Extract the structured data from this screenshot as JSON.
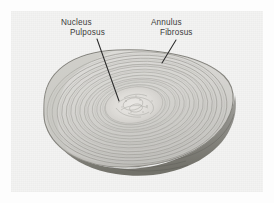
{
  "figure": {
    "type": "anatomical-photograph",
    "background_color": "#fdfdfd",
    "plate_color": "#f3f3f2"
  },
  "labels": [
    {
      "name": "nucleus-pulposus",
      "line1": "Nucleus",
      "line2": "Pulposus",
      "text_color": "#3b3b3b",
      "leader": {
        "x1": 97,
        "y1": 39,
        "x2": 119,
        "y2": 101
      }
    },
    {
      "name": "annulus-fibrosus",
      "line1": "Annulus",
      "line2": "Fibrosus",
      "text_color": "#3b3b3b",
      "leader": {
        "x1": 176,
        "y1": 40,
        "x2": 162,
        "y2": 63
      }
    }
  ],
  "specimen": {
    "annulus_fibrosus": {
      "description": "Concentric lamellar rings forming the outer fibrous ring",
      "ring_count": 17,
      "fill_color": "#d9d8d5",
      "lamella_color": "#9d9c98",
      "outline_color": "#7f7e7a"
    },
    "nucleus_pulposus": {
      "description": "Central mottled gelatinous core",
      "fill_color": "#e6e5e2",
      "mottle_color": "#b4b3ae"
    },
    "cut_edge": {
      "description": "Shaded lateral wall of the disc beneath the cut surface",
      "shadow_color": "#8e8d88",
      "deep_shadow_color": "#6d6c67"
    }
  }
}
